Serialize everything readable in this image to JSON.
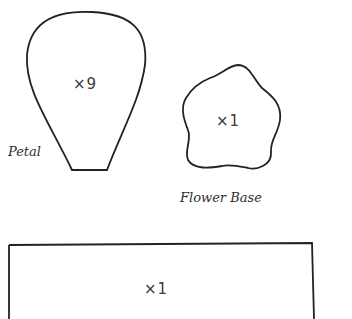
{
  "pieces": {
    "petal": {
      "label": "Petal",
      "count": "×9"
    },
    "flower_base": {
      "label": "Flower Base",
      "count": "×1"
    },
    "rectangle": {
      "count": "×1"
    }
  },
  "colors": {
    "outline": "#222222",
    "text": "#3a3a3a"
  }
}
